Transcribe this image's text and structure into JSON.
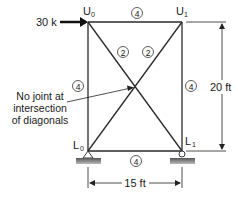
{
  "figure": {
    "type": "truss",
    "nodes": {
      "U0": {
        "label": "U",
        "sub": "0"
      },
      "U1": {
        "label": "U",
        "sub": "1"
      },
      "L0": {
        "label": "L",
        "sub": "0"
      },
      "L1": {
        "label": "L",
        "sub": "1"
      }
    },
    "load": {
      "label": "30 k",
      "node": "U0",
      "direction": "right"
    },
    "member_areas": {
      "top_chord": "4",
      "bottom_chord": "4",
      "left_vertical": "4",
      "right_vertical": "4",
      "diagonal_left": "2",
      "diagonal_right": "2"
    },
    "annotation": {
      "line1": "No joint at",
      "line2": "intersection",
      "line3": "of diagonals"
    },
    "dimensions": {
      "height": "20 ft",
      "width": "15 ft"
    },
    "supports": {
      "L0": "pin",
      "L1": "roller"
    }
  }
}
